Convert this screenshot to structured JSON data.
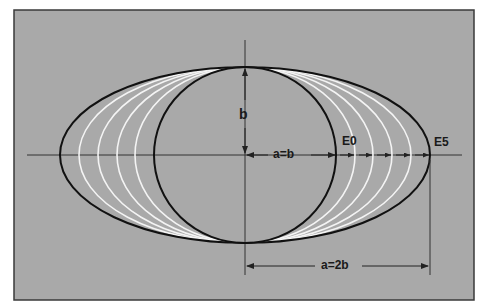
{
  "diagram": {
    "type": "ellipse-eccentricity-progression",
    "colors": {
      "page_background": "#ffffff",
      "panel_background": "#a9a9a9",
      "panel_border": "#3a3a3a",
      "outline_curves": "#111111",
      "intermediate_curves": "#f4f4f4",
      "axis_lines": "#333333",
      "text": "#1a1a1a"
    },
    "geometry": {
      "panel": {
        "x": 14,
        "y": 10,
        "width": 460,
        "height": 290
      },
      "center": {
        "x": 245,
        "y": 155
      },
      "semi_minor_b_px": 88,
      "circle_radius_px": 91,
      "outer_semi_major_px": 185,
      "intermediate_semi_major_px": [
        110,
        128,
        147,
        166
      ]
    },
    "labels": {
      "b": "b",
      "a_equals_b": "a=b",
      "e0": "E0",
      "e5": "E5",
      "a_equals_2b": "a=2b"
    },
    "curves": [
      {
        "name": "E0",
        "description": "circle, a=b",
        "style": "black"
      },
      {
        "name": "E1",
        "style": "white"
      },
      {
        "name": "E2",
        "style": "white"
      },
      {
        "name": "E3",
        "style": "white"
      },
      {
        "name": "E4",
        "style": "white"
      },
      {
        "name": "E5",
        "description": "ellipse, a=2b",
        "style": "black"
      }
    ]
  }
}
